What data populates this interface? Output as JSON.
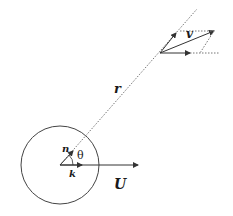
{
  "diagram": {
    "labels": {
      "velocity": "v",
      "radius": "r",
      "normal": "n",
      "angle": "θ",
      "unit_k": "k",
      "free_stream": "U"
    },
    "colors": {
      "line": "#333333",
      "dotted": "#777777",
      "background": "#ffffff"
    },
    "geometry": {
      "circle_center": [
        60,
        165
      ],
      "circle_radius": 39,
      "velocity_origin": [
        160,
        53
      ]
    }
  }
}
